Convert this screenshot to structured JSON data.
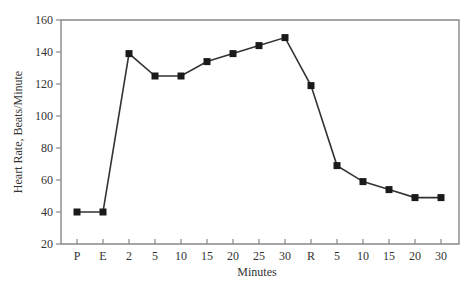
{
  "chart_data": {
    "type": "line",
    "title": "",
    "xlabel": "Minutes",
    "ylabel": "Heart Rate, Beats/Minute",
    "categories": [
      "P",
      "E",
      "2",
      "5",
      "10",
      "15",
      "20",
      "25",
      "30",
      "R",
      "5",
      "10",
      "15",
      "20",
      "30"
    ],
    "series": [
      {
        "name": "Heart Rate",
        "values": [
          40,
          40,
          139,
          125,
          125,
          134,
          139,
          144,
          149,
          119,
          69,
          59,
          54,
          49,
          49
        ],
        "marker": "square",
        "color": "#222222"
      }
    ],
    "ylim": [
      20,
      160
    ],
    "yticks": [
      20,
      40,
      60,
      80,
      100,
      120,
      140,
      160
    ],
    "grid": false,
    "legend": "none"
  },
  "colors": {
    "axis": "#888888",
    "line": "#333333",
    "marker": "#1a1a1a",
    "text": "#333333"
  }
}
